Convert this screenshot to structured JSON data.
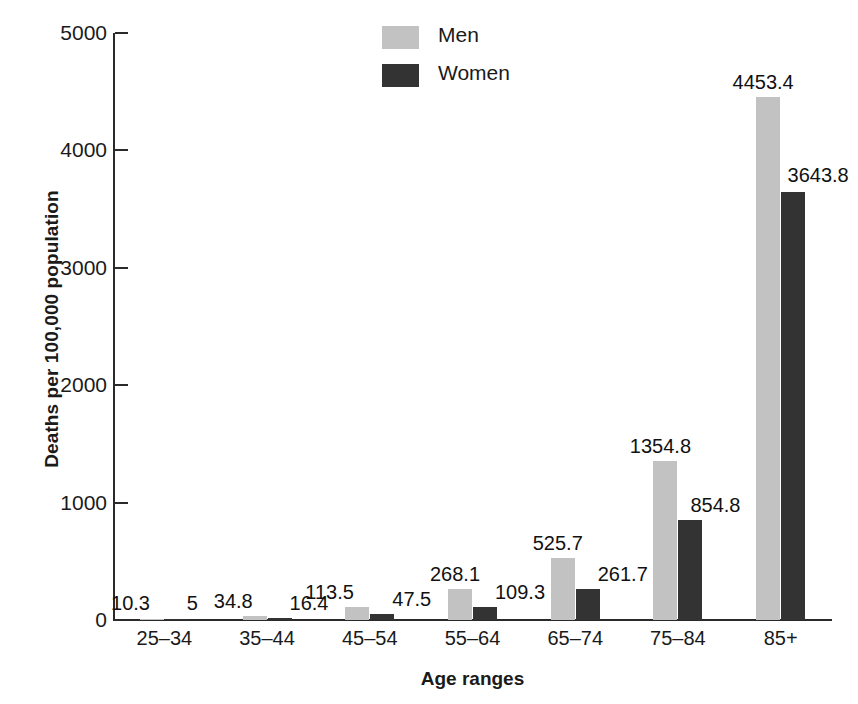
{
  "chart_data": {
    "type": "bar",
    "title": "",
    "xlabel": "Age ranges",
    "ylabel": "Deaths per 100,000 population",
    "categories": [
      "25–34",
      "35–44",
      "45–54",
      "55–64",
      "65–74",
      "75–84",
      "85+"
    ],
    "series": [
      {
        "name": "Men",
        "color": "#c2c2c2",
        "values": [
          10.3,
          34.8,
          113.5,
          268.1,
          525.7,
          1354.8,
          4453.4
        ]
      },
      {
        "name": "Women",
        "color": "#333333",
        "values": [
          5,
          16.4,
          47.5,
          109.3,
          261.7,
          854.8,
          3643.8
        ]
      }
    ],
    "value_labels": {
      "Men": [
        "10.3",
        "34.8",
        "113.5",
        "268.1",
        "525.7",
        "1354.8",
        "4453.4"
      ],
      "Women": [
        "5",
        "16.4",
        "47.5",
        "109.3",
        "261.7",
        "854.8",
        "3643.8"
      ]
    },
    "ylim": [
      0,
      5000
    ],
    "yticks": [
      0,
      1000,
      2000,
      3000,
      4000,
      5000
    ],
    "ytick_labels": [
      "0",
      "1000",
      "2000",
      "3000",
      "4000",
      "5000"
    ],
    "grid": false,
    "legend_position": "top-center"
  },
  "legend": {
    "items": [
      {
        "label": "Men",
        "color": "#c2c2c2"
      },
      {
        "label": "Women",
        "color": "#333333"
      }
    ]
  }
}
